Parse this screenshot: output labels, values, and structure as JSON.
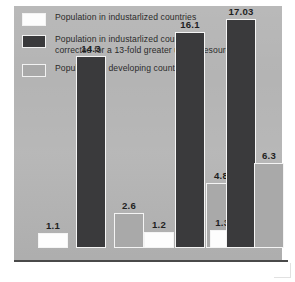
{
  "legend": {
    "items": [
      {
        "label": "Population in industarlized countries",
        "swatch": "white-swatch",
        "color": "#fdfdfd"
      },
      {
        "label": "Population in industarlized countries\ncorrected for a 13-fold greater use of resources",
        "swatch": "dark-swatch",
        "color": "#3a3a3c"
      },
      {
        "label": "Population in developing countries",
        "swatch": "gray-swatch",
        "color": "#a9a9a9"
      }
    ]
  },
  "chart_data": {
    "type": "bar",
    "title": "",
    "xlabel": "",
    "ylabel": "",
    "ylim": [
      0,
      18
    ],
    "grid": false,
    "legend_position": "top-left",
    "categories": [
      "Group 1",
      "Group 2",
      "Group 3"
    ],
    "series": [
      {
        "name": "Population in industarlized countries",
        "color": "#fdfdfd",
        "values": [
          1.1,
          1.2,
          1.31
        ],
        "labels": [
          "1.1",
          "1.2",
          "1.31"
        ]
      },
      {
        "name": "Population in industarlized countries corrected for a 13-fold greater use of resources",
        "color": "#3a3a3c",
        "values": [
          14.3,
          16.1,
          17.03
        ],
        "labels": [
          "14.3",
          "16.1",
          "17.03"
        ]
      },
      {
        "name": "Population in developing countries",
        "color": "#a9a9a9",
        "values": [
          2.6,
          4.8,
          6.3
        ],
        "labels": [
          "2.6",
          "4.8",
          "6.3"
        ]
      }
    ]
  },
  "style": {
    "panel_color": "#b4b4b4",
    "axis_color": "#4a4a4a",
    "bar_outline": "#f4f4f4",
    "text_color": "#2b2b2b"
  }
}
